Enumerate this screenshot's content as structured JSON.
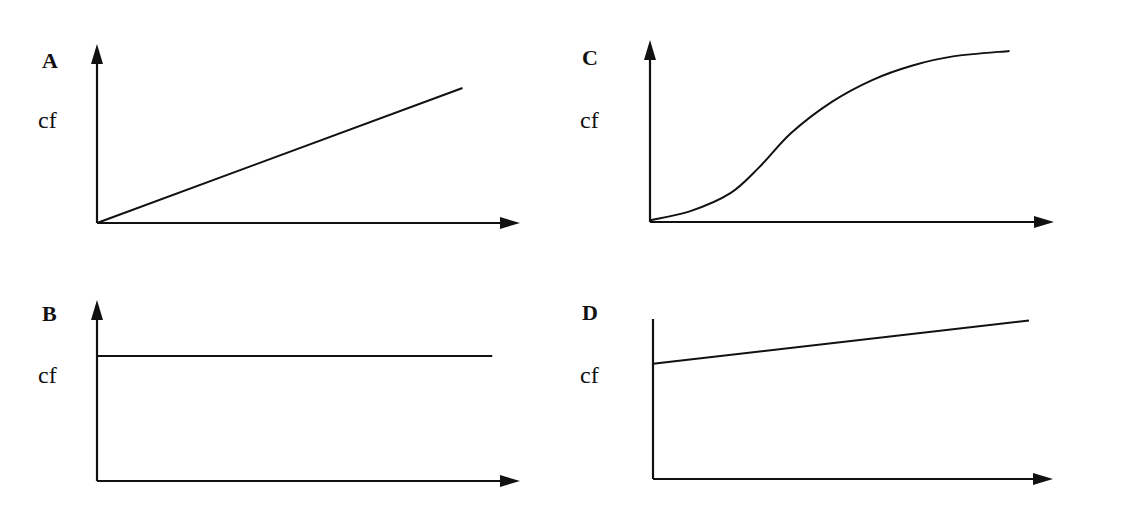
{
  "figure": {
    "panels": [
      {
        "id": "A",
        "letter": "A",
        "ylabel": "cf",
        "shape": "straight line rising from origin"
      },
      {
        "id": "B",
        "letter": "B",
        "ylabel": "cf",
        "shape": "horizontal constant line"
      },
      {
        "id": "C",
        "letter": "C",
        "ylabel": "cf",
        "shape": "S-shaped (ogive) curve"
      },
      {
        "id": "D",
        "letter": "D",
        "ylabel": "cf",
        "shape": "gently rising line with positive intercept"
      }
    ]
  },
  "chart_data": [
    {
      "type": "line",
      "title": "A",
      "xlabel": "",
      "ylabel": "cf",
      "xlim": [
        0,
        1
      ],
      "ylim": [
        0,
        1
      ],
      "x": [
        0,
        0.86
      ],
      "series": [
        {
          "name": "A",
          "values": [
            0,
            0.75
          ]
        }
      ],
      "grid": false
    },
    {
      "type": "line",
      "title": "B",
      "xlabel": "",
      "ylabel": "cf",
      "xlim": [
        0,
        1
      ],
      "ylim": [
        0,
        1
      ],
      "x": [
        0,
        0.93
      ],
      "series": [
        {
          "name": "B",
          "values": [
            0.69,
            0.69
          ]
        }
      ],
      "grid": false
    },
    {
      "type": "line",
      "title": "C",
      "xlabel": "",
      "ylabel": "cf",
      "xlim": [
        0,
        1
      ],
      "ylim": [
        0,
        1
      ],
      "x": [
        0,
        0.1,
        0.2,
        0.27,
        0.35,
        0.45,
        0.55,
        0.65,
        0.75,
        0.89
      ],
      "series": [
        {
          "name": "C",
          "values": [
            0.01,
            0.06,
            0.16,
            0.3,
            0.49,
            0.66,
            0.78,
            0.86,
            0.91,
            0.94
          ]
        }
      ],
      "grid": false
    },
    {
      "type": "line",
      "title": "D",
      "xlabel": "",
      "ylabel": "cf",
      "xlim": [
        0,
        1
      ],
      "ylim": [
        0,
        1
      ],
      "x": [
        0,
        0.94
      ],
      "series": [
        {
          "name": "D",
          "values": [
            0.72,
            0.99
          ]
        }
      ],
      "grid": false
    }
  ]
}
